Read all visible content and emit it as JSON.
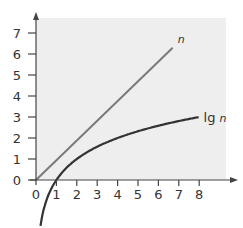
{
  "chart_data": {
    "type": "line",
    "title": "",
    "xlabel": "",
    "ylabel": "",
    "xlim": [
      0,
      8
    ],
    "ylim": [
      0,
      7
    ],
    "x_ticks": [
      "0",
      "1",
      "2",
      "3",
      "4",
      "5",
      "6",
      "7",
      "8"
    ],
    "y_ticks": [
      "0",
      "1",
      "2",
      "3",
      "4",
      "5",
      "6",
      "7"
    ],
    "grid": false,
    "legend": "inline labels at line ends",
    "series": [
      {
        "name": "n",
        "label_plain": "",
        "label_italic": "n",
        "color": "#7a7a7a",
        "x": [
          0,
          6.7
        ],
        "y": [
          0,
          6.3
        ]
      },
      {
        "name": "lg n",
        "label_plain": "lg ",
        "label_italic": "n",
        "color": "#333333",
        "x": [
          0.25,
          0.5,
          1,
          2,
          3,
          4,
          5,
          6,
          7,
          8
        ],
        "y": [
          -2,
          -1,
          0,
          1,
          1.585,
          2,
          2.32,
          2.585,
          2.807,
          3
        ]
      }
    ]
  },
  "colors": {
    "plot_background": "#eeeeee",
    "axis": "#444444"
  }
}
